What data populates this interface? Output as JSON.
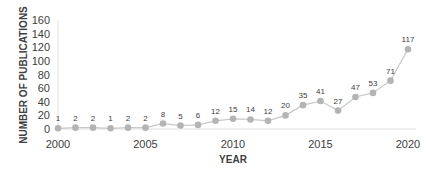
{
  "chart_data": {
    "type": "line",
    "title": "",
    "xlabel": "YEAR",
    "ylabel": "NUMBER OF PUBLICATIONS",
    "x": [
      2000,
      2001,
      2002,
      2003,
      2004,
      2005,
      2006,
      2007,
      2008,
      2009,
      2010,
      2011,
      2012,
      2013,
      2014,
      2015,
      2016,
      2017,
      2018,
      2019,
      2020
    ],
    "series": [
      {
        "name": "Publications",
        "values": [
          1,
          2,
          2,
          1,
          2,
          2,
          8,
          5,
          6,
          12,
          15,
          14,
          12,
          20,
          35,
          41,
          27,
          47,
          53,
          71,
          117
        ]
      }
    ],
    "ylim": [
      0,
      160
    ],
    "yticks": [
      0,
      20,
      40,
      60,
      80,
      100,
      120,
      140,
      160
    ],
    "xticks": [
      2000,
      2005,
      2010,
      2015,
      2020
    ],
    "grid": false,
    "legend": null,
    "data_labels": true,
    "colors": {
      "line": "#c8c8c8",
      "marker": "#b4b4b4",
      "text": "#404040",
      "axis": "#d9d9d9"
    }
  }
}
